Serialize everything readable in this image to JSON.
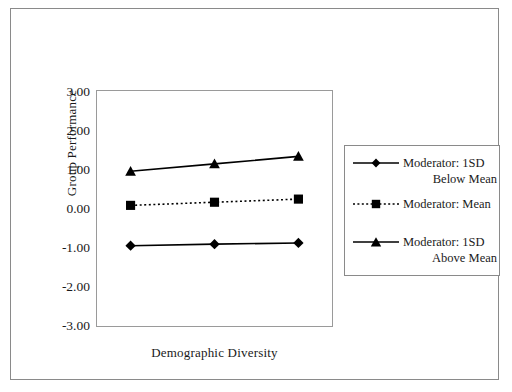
{
  "chart_data": {
    "type": "line",
    "title": "",
    "xlabel": "Demographic Diversity",
    "ylabel": "Group Performance",
    "x": [
      -1,
      0,
      1
    ],
    "x_tick_labels": [],
    "y_tick_labels": [
      "3.00",
      "2.00",
      "1.00",
      "0.00",
      "-1.00",
      "-2.00",
      "-3.00"
    ],
    "y_ticks": [
      3,
      2,
      1,
      0,
      -1,
      -2,
      -3
    ],
    "ylim": [
      -3,
      3
    ],
    "xlim": [
      -1.4,
      1.4
    ],
    "grid": false,
    "legend_position": "right",
    "series": [
      {
        "name": "Moderator: 1SD Below Mean",
        "name_line1": "Moderator: 1SD",
        "name_line2": "Below Mean",
        "marker": "diamond",
        "linestyle": "solid",
        "color": "#000000",
        "values": [
          -0.95,
          -0.91,
          -0.88
        ]
      },
      {
        "name": "Moderator: Mean",
        "name_line1": "Moderator: Mean",
        "name_line2": "",
        "marker": "square",
        "linestyle": "dotted",
        "color": "#000000",
        "values": [
          0.08,
          0.16,
          0.24
        ]
      },
      {
        "name": "Moderator: 1SD Above Mean",
        "name_line1": "Moderator: 1SD",
        "name_line2": "Above Mean",
        "marker": "triangle",
        "linestyle": "solid",
        "color": "#000000",
        "values": [
          0.95,
          1.14,
          1.33
        ]
      }
    ]
  },
  "axes": {
    "y_title": "Group Performance",
    "x_title": "Demographic Diversity",
    "y_labels": {
      "t0": "3.00",
      "t1": "2.00",
      "t2": "1.00",
      "t3": "0.00",
      "t4": "-1.00",
      "t5": "-2.00",
      "t6": "-3.00"
    }
  },
  "legend": {
    "entries": [
      {
        "line1": "Moderator: 1SD",
        "line2": "Below Mean",
        "marker": "diamond",
        "linestyle": "solid"
      },
      {
        "line1": "Moderator: Mean",
        "line2": "",
        "marker": "square",
        "linestyle": "dotted"
      },
      {
        "line1": "Moderator: 1SD",
        "line2": "Above Mean",
        "marker": "triangle",
        "linestyle": "solid"
      }
    ]
  },
  "colors": {
    "ink": "#000000",
    "frame": "#8a8a8a",
    "axis": "#9a9a9a",
    "background": "#ffffff"
  }
}
